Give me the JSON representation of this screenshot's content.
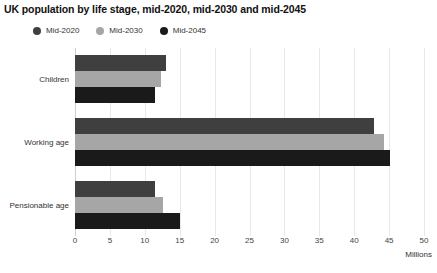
{
  "chart_data": {
    "type": "bar",
    "orientation": "horizontal",
    "title": "UK population by life stage, mid-2020, mid-2030 and mid-2045",
    "xlabel": "Millions",
    "ylabel": "",
    "xlim": [
      0,
      50
    ],
    "xticks": [
      0,
      5,
      10,
      15,
      20,
      25,
      30,
      35,
      40,
      45,
      50
    ],
    "xtick_labels": [
      "0",
      "5",
      "10",
      "15",
      "20",
      "25",
      "30",
      "35",
      "40",
      "45",
      "50"
    ],
    "grid": true,
    "grid_axis": "x",
    "legend_position": "top-left",
    "categories": [
      "Children",
      "Working age",
      "Pensionable age"
    ],
    "series": [
      {
        "name": "Mid-2020",
        "color": "#3f3f3f",
        "values": [
          13.0,
          42.9,
          11.4
        ]
      },
      {
        "name": "Mid-2030",
        "color": "#a6a6a6",
        "values": [
          12.3,
          44.2,
          12.6
        ]
      },
      {
        "name": "Mid-2045",
        "color": "#1a1a1a",
        "values": [
          11.4,
          45.1,
          15.0
        ]
      }
    ]
  },
  "colors": {
    "background": "#ffffff",
    "gridline": "#e8e8e8",
    "axis": "#cfcfcf",
    "text": "#333333",
    "title_text": "#111111"
  }
}
